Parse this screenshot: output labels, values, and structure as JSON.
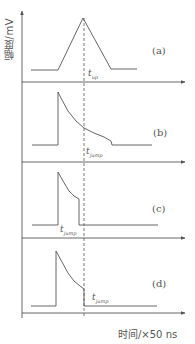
{
  "figure": {
    "y_axis_label": "幅度/mV",
    "x_axis_label": "时间/×50 ns",
    "dashed_marker": "reference time line"
  },
  "panels": [
    {
      "id": "a",
      "label": "(a)",
      "time_label": "t",
      "time_sub": "up",
      "shape": "triangular pulse"
    },
    {
      "id": "b",
      "label": "(b)",
      "time_label": "t",
      "time_sub": "jump",
      "shape": "sharp rise, slow decay, late step drop"
    },
    {
      "id": "c",
      "label": "(c)",
      "time_label": "t",
      "time_sub": "jump",
      "shape": "sharp rise, decay, early step drop"
    },
    {
      "id": "d",
      "label": "(d)",
      "time_label": "t",
      "time_sub": "jump",
      "shape": "sharp rise, decay, step drop at marker"
    }
  ],
  "colors": {
    "line": "#555555",
    "text": "#555555",
    "background": "#ffffff"
  }
}
